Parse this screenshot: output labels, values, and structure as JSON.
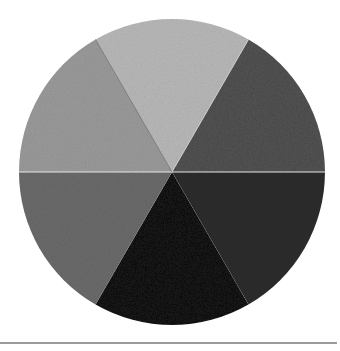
{
  "image": {
    "subject": "Hand-painted grayscale value wheel divided into six equal segments",
    "background": "#ffffff",
    "wheel": {
      "center": [
        172,
        172
      ],
      "radius": 153,
      "segment_count": 6,
      "segments": [
        {
          "position": "top",
          "color": "#b9b9b9",
          "tone": "light gray"
        },
        {
          "position": "upper-right",
          "color": "#545454",
          "tone": "dark gray (textured)"
        },
        {
          "position": "lower-right",
          "color": "#2d2d2d",
          "tone": "very dark gray"
        },
        {
          "position": "bottom",
          "color": "#131313",
          "tone": "near black"
        },
        {
          "position": "lower-left",
          "color": "#6b6b6b",
          "tone": "medium gray"
        },
        {
          "position": "upper-left",
          "color": "#9b9b9b",
          "tone": "light-medium gray"
        }
      ]
    },
    "baseline": {
      "color": "#9a9a9a",
      "y": 343
    }
  }
}
